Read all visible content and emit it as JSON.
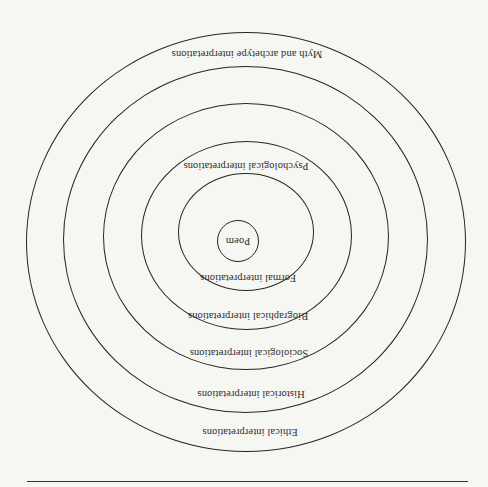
{
  "diagram": {
    "type": "concentric-rings",
    "orientation_degrees": 180,
    "colors": {
      "background": "#f6f6f3",
      "stroke": "#262626",
      "text": "#2e2e2e"
    },
    "center_label": "Poem",
    "rings": [
      {
        "id": "formal",
        "label": "Formal interpretations"
      },
      {
        "id": "psychological",
        "label": "Psychological interpretations"
      },
      {
        "id": "biographical",
        "label": "Biographical interpretations"
      },
      {
        "id": "sociological",
        "label": "Sociological interpretations"
      },
      {
        "id": "historical",
        "label": "Historical interpretations"
      },
      {
        "id": "ethical",
        "label": "Ethical interpretations"
      },
      {
        "id": "myth",
        "label": "Myth and archetype interpretations"
      }
    ]
  }
}
